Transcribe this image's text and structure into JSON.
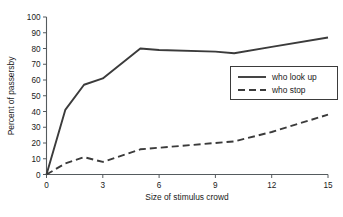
{
  "chart_data": {
    "type": "line",
    "title": "",
    "subtitle": "",
    "xlabel": "Size of stimulus crowd",
    "ylabel": "Percent of passersby",
    "xlim": [
      0,
      15
    ],
    "ylim": [
      0,
      100
    ],
    "xticks": [
      0,
      3,
      6,
      9,
      12,
      15
    ],
    "xtick_labels": [
      "0",
      "3",
      "6",
      "9",
      "12",
      "15"
    ],
    "yticks": [
      0,
      10,
      20,
      30,
      40,
      50,
      60,
      70,
      80,
      90,
      100
    ],
    "ytick_labels": [
      "0",
      "10",
      "20",
      "30",
      "40",
      "50",
      "60",
      "70",
      "80",
      "90",
      "100"
    ],
    "grid": false,
    "legend_position": "center-right",
    "x": [
      0,
      1,
      2,
      3,
      5,
      6,
      9,
      10,
      12,
      15
    ],
    "series": [
      {
        "name": "who look up",
        "style": "solid",
        "color": "#3b3b3b",
        "values": [
          0,
          41,
          57,
          61,
          80,
          79,
          78,
          77,
          81,
          87
        ]
      },
      {
        "name": "who stop",
        "style": "dashed",
        "color": "#3b3b3b",
        "values": [
          0,
          7,
          11,
          8,
          16,
          17,
          20,
          21,
          27,
          38
        ]
      }
    ]
  },
  "legend": {
    "entries": [
      {
        "label": "who look up"
      },
      {
        "label": "who stop"
      }
    ]
  },
  "colors": {
    "line": "#3b3b3b",
    "axis": "#555b5e",
    "text": "#1a1a1a",
    "background": "#ffffff"
  }
}
